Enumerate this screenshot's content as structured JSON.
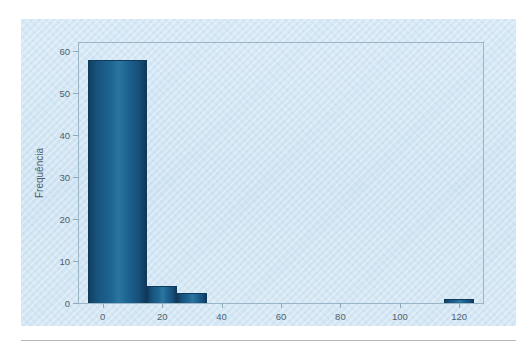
{
  "page": {
    "background_color": "#ffffff",
    "clipped_header_text": "",
    "footer_rule_color": "#b7b7b7"
  },
  "figure": {
    "panel_color": "#d3e6f4",
    "frame_color": "#9bb4c6",
    "bar_color": "#1d6590",
    "bar_edge_color": "#0f3a5c",
    "tick_text_color": "#4e5f6d"
  },
  "chart_data": {
    "type": "bar",
    "title": "",
    "subtitle": "",
    "xlabel": "",
    "ylabel": "Frequência",
    "xlim": [
      -8,
      128
    ],
    "ylim": [
      0,
      62
    ],
    "grid": false,
    "legend": null,
    "x_ticks": [
      0,
      20,
      40,
      60,
      80,
      100,
      120
    ],
    "x_tick_labels": [
      "0",
      "20",
      "40",
      "60",
      "80",
      "100",
      "120"
    ],
    "y_ticks": [
      0,
      10,
      20,
      30,
      40,
      50,
      60
    ],
    "y_tick_labels": [
      "0",
      "10",
      "20",
      "30",
      "40",
      "50",
      "60"
    ],
    "bin_width": 10,
    "bars": [
      {
        "bin_start": -5,
        "bin_end": 15,
        "center": 5,
        "value": 58
      },
      {
        "bin_start": 15,
        "bin_end": 25,
        "center": 20,
        "value": 4
      },
      {
        "bin_start": 25,
        "bin_end": 35,
        "center": 30,
        "value": 2.5
      },
      {
        "bin_start": 115,
        "bin_end": 125,
        "center": 120,
        "value": 1
      }
    ],
    "categories": [
      "5",
      "20",
      "30",
      "120"
    ],
    "values": [
      58,
      4,
      2.5,
      1
    ]
  }
}
